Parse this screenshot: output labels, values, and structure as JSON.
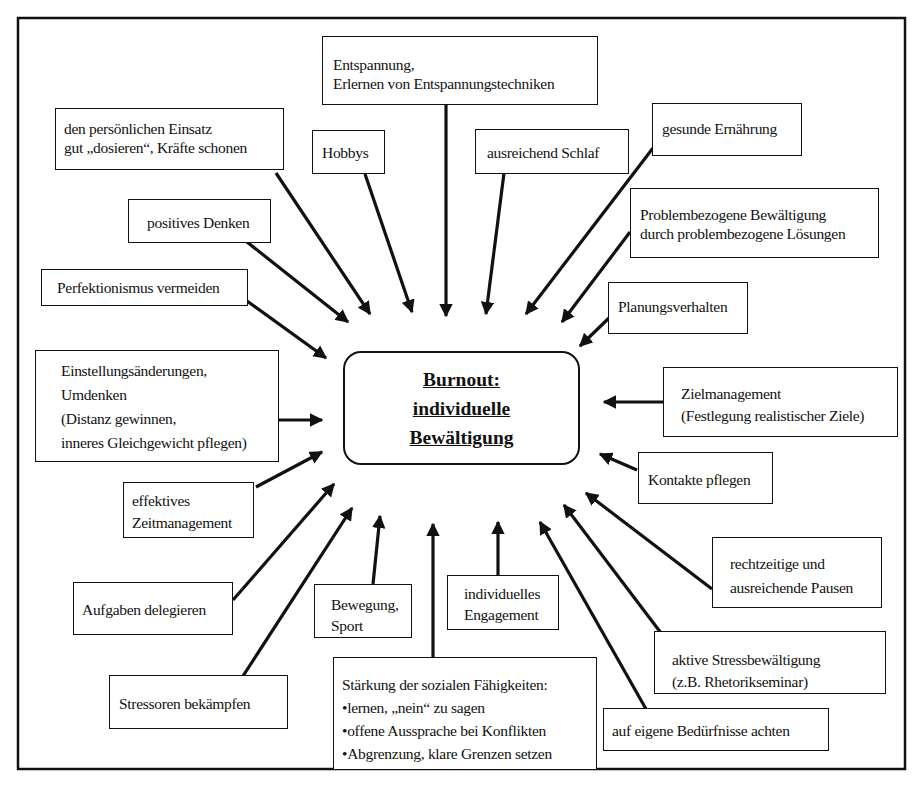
{
  "center": {
    "lines": [
      "Burnout:",
      "individuelle",
      "Bewältigung"
    ]
  },
  "boxes": {
    "entspannung": [
      "Entspannung,",
      "Erlernen von Entspannungstechniken"
    ],
    "einsatz": [
      "den persönlichen Einsatz",
      "gut „dosieren“, Kräfte schonen"
    ],
    "hobbys": [
      "Hobbys"
    ],
    "schlaf": [
      "ausreichend Schlaf"
    ],
    "ernaehrung": [
      "gesunde Ernährung"
    ],
    "denken": [
      "positives Denken"
    ],
    "problem": [
      "Problembezogene Bewältigung",
      "durch problembezogene Lösungen"
    ],
    "perfektionismus": [
      "Perfektionismus vermeiden"
    ],
    "planung": [
      "Planungsverhalten"
    ],
    "einstellung": [
      "Einstellungsänderungen,",
      "Umdenken",
      "(Distanz gewinnen,",
      "inneres Gleichgewicht pflegen)"
    ],
    "ziel": [
      "Zielmanagement",
      "(Festlegung realistischer Ziele)"
    ],
    "zeit": [
      "effektives",
      "Zeitmanagement"
    ],
    "kontakte": [
      "Kontakte pflegen"
    ],
    "pausen": [
      "rechtzeitige und",
      "ausreichende Pausen"
    ],
    "delegieren": [
      "Aufgaben delegieren"
    ],
    "bewegung": [
      "Bewegung,",
      "Sport"
    ],
    "engagement": [
      "individuelles",
      "Engagement"
    ],
    "stress": [
      "aktive Stressbewältigung",
      "(z.B. Rhetorikseminar)"
    ],
    "stressoren": [
      "Stressoren bekämpfen"
    ],
    "sozial": [
      "Stärkung der sozialen Fähigkeiten:",
      "•lernen, „nein“ zu sagen",
      "•offene Aussprache bei Konflikten",
      "•Abgrenzung, klare Grenzen setzen"
    ],
    "beduerfnisse": [
      "auf eigene Bedürfnisse achten"
    ]
  }
}
